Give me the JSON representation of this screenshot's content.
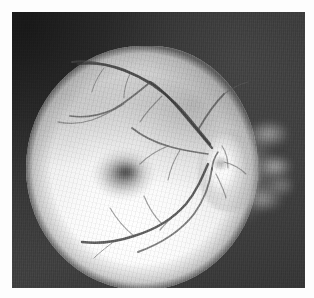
{
  "document": {
    "kind": "grayscale-fundus-photograph",
    "caption": ""
  },
  "plate": {
    "label": "retinal-fundus-plate",
    "background_color": "#393939",
    "margin_color": "#fdfdfd"
  },
  "anatomy": {
    "retinal_field": {
      "name": "retinal-field",
      "description": "bright oval retinal field occupying left two-thirds of the frame",
      "tone": "#f7f7f7"
    },
    "macula": {
      "name": "macula",
      "description": "diffuse dark blotch left of centre",
      "tone": "#4a4a4a"
    },
    "optic_disc": {
      "name": "optic-disc",
      "description": "bright irregular blob at the right margin of the retinal field with radiating streaks",
      "tone": "#ffffff"
    },
    "vessels": {
      "name": "retinal-vessels",
      "description": "superior and inferior arcades branching leftward from the optic disc",
      "tone": "#3a3a3a"
    }
  },
  "colors": {
    "surround_dark": "#393939",
    "surround_light": "#424242",
    "retina_bright": "#ffffff",
    "retina_mid": "#ebebeb",
    "macula_dark": "#484848",
    "vessel_dark": "#3a3a3a",
    "page_white": "#fdfdfd"
  }
}
